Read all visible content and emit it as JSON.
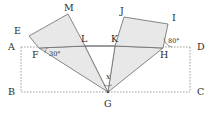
{
  "figure": {
    "type": "geometry-diagram",
    "colors": {
      "shape_fill": "#e8e8e8",
      "stroke": "#6a6a6a",
      "dashed_stroke": "#8a8a8a",
      "label": "#2b2b2b",
      "background": "#ffffff"
    }
  },
  "vertices": [
    {
      "name": "A",
      "label": "A",
      "x": 21,
      "y": 47,
      "label_x": 8,
      "label_y": 50
    },
    {
      "name": "B",
      "label": "B",
      "x": 21,
      "y": 92,
      "label_x": 8,
      "label_y": 95
    },
    {
      "name": "C",
      "label": "C",
      "x": 190,
      "y": 92,
      "label_x": 197,
      "label_y": 95
    },
    {
      "name": "D",
      "label": "D",
      "x": 190,
      "y": 47,
      "label_x": 197,
      "label_y": 50
    },
    {
      "name": "E",
      "label": "E",
      "x": 29,
      "y": 36,
      "label_x": 14,
      "label_y": 34
    },
    {
      "name": "F",
      "label": "F",
      "x": 39,
      "y": 48,
      "label_x": 32,
      "label_y": 58
    },
    {
      "name": "G",
      "label": "G",
      "x": 108,
      "y": 92,
      "label_x": 104,
      "label_y": 107
    },
    {
      "name": "H",
      "label": "H",
      "x": 163,
      "y": 48,
      "label_x": 160,
      "label_y": 58
    },
    {
      "name": "I",
      "label": "I",
      "x": 168,
      "y": 24,
      "label_x": 172,
      "label_y": 21
    },
    {
      "name": "J",
      "label": "J",
      "x": 124,
      "y": 17,
      "label_x": 120,
      "label_y": 14
    },
    {
      "name": "K",
      "label": "K",
      "x": 115,
      "y": 46,
      "label_x": 111,
      "label_y": 42
    },
    {
      "name": "L",
      "label": "L",
      "x": 85,
      "y": 46,
      "label_x": 81,
      "label_y": 42
    },
    {
      "name": "M",
      "label": "M",
      "x": 68,
      "y": 14,
      "label_x": 64,
      "label_y": 11
    }
  ],
  "angles": [
    {
      "name": "angle-at-F",
      "label": "30°",
      "at_vertex": "F",
      "label_x": 49,
      "label_y": 56
    },
    {
      "name": "angle-at-H",
      "label": "80°",
      "at_vertex": "H",
      "label_x": 168,
      "label_y": 43
    },
    {
      "name": "angle-at-G",
      "label": "x",
      "at_vertex": "G",
      "label_x": 106,
      "label_y": 79
    }
  ],
  "shapes": [
    {
      "name": "quad-EMLF",
      "points": "29,36 68,14 85,46 39,48",
      "fill": "shaded"
    },
    {
      "name": "quad-JIHK",
      "points": "124,17 168,24 163,48 115,46",
      "fill": "shaded"
    },
    {
      "name": "triangle-FLG",
      "points": "39,48 85,46 108,92",
      "fill": "shaded"
    },
    {
      "name": "triangle-KHG",
      "points": "115,46 163,48 108,92",
      "fill": "shaded"
    },
    {
      "name": "triangle-LKG",
      "points": "85,46 115,46 108,92",
      "fill": "white"
    }
  ],
  "lines": {
    "solid": [
      {
        "name": "segment-LK",
        "x1": 85,
        "y1": 46,
        "x2": 115,
        "y2": 46
      }
    ],
    "dashed_rectangle": [
      {
        "name": "side-AD",
        "x1": 21,
        "y1": 47,
        "x2": 190,
        "y2": 47
      },
      {
        "name": "side-AB",
        "x1": 21,
        "y1": 47,
        "x2": 21,
        "y2": 92
      },
      {
        "name": "side-BC",
        "x1": 21,
        "y1": 92,
        "x2": 190,
        "y2": 92
      },
      {
        "name": "side-DC",
        "x1": 190,
        "y1": 47,
        "x2": 190,
        "y2": 92
      }
    ]
  }
}
